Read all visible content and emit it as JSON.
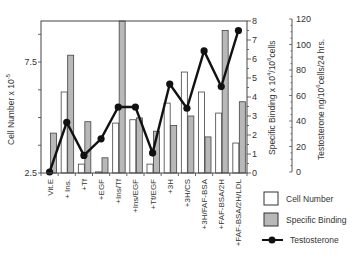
{
  "chart_data": {
    "type": "bar",
    "title": "",
    "categories": [
      "Vit.E",
      "+ Ins.",
      "+Tf",
      "+EGF",
      "+Ins/Tf",
      "+Ins/EGF",
      "+Tf/EGF",
      "+3H",
      "+3H/CS",
      "+3H/FAF-BSA",
      "+FAF-BSA/2H",
      "+FAF-BSA/2H/LDL"
    ],
    "series": [
      {
        "name": "Cell Number",
        "axis": "left",
        "type": "bar",
        "fill": "#ffffff",
        "values": [
          2.5,
          6.15,
          2.9,
          2.55,
          4.75,
          4.9,
          2.9,
          5.65,
          7.05,
          6.15,
          5.2,
          3.85
        ]
      },
      {
        "name": "Specific Binding",
        "axis": "right1",
        "type": "bar",
        "fill": "#b8b8b8",
        "values": [
          2.1,
          6.2,
          2.7,
          0.8,
          8.0,
          2.9,
          2.2,
          2.5,
          3.0,
          1.9,
          7.5,
          3.75
        ]
      },
      {
        "name": "Testosterone",
        "axis": "right2",
        "type": "line",
        "color": "#111111",
        "values": [
          0,
          39,
          13,
          26,
          51,
          51,
          15,
          69,
          50,
          95,
          67,
          111
        ]
      }
    ],
    "axes": {
      "left": {
        "label": "Cell Number x 10",
        "label_sup": "-5",
        "ticks": [
          "2.5",
          "7.5"
        ],
        "range": [
          2.5,
          9.35
        ]
      },
      "right1": {
        "label": "Specific Binding x 10",
        "label_sup1": "4",
        "label_mid": "/10",
        "label_sup2": "6",
        "label_end": "cells",
        "ticks": [
          "0",
          "1",
          "2",
          "3",
          "4",
          "5",
          "6",
          "7",
          "8"
        ],
        "range": [
          0,
          8
        ]
      },
      "right2": {
        "label": "Testosterone ng/10",
        "label_sup": "6",
        "label_end": "cells/24 hrs.",
        "ticks": [
          "0",
          "20",
          "40",
          "60",
          "80",
          "100",
          "120"
        ],
        "range": [
          0,
          120
        ]
      }
    },
    "legend": [
      "Cell Number",
      "Specific Binding",
      "Testosterone"
    ],
    "legend_position": "bottom-right",
    "grid": false
  }
}
